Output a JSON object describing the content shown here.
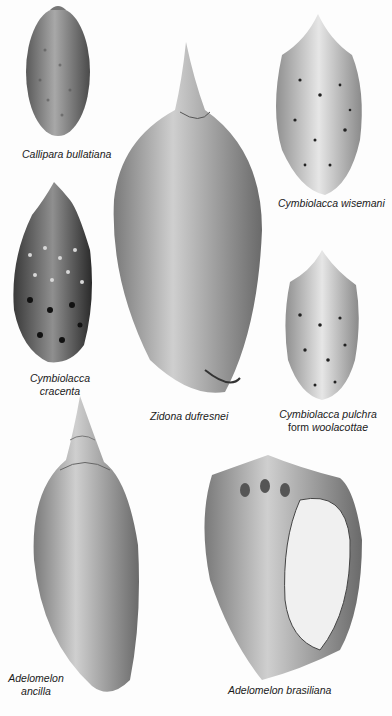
{
  "plate": {
    "background": "#fdfdfd",
    "shells": [
      {
        "id": "callipara-bullatiana",
        "caption": "Callipara bullatiana"
      },
      {
        "id": "zidona-dufresnei",
        "caption": "Zidona dufresnei"
      },
      {
        "id": "cymbiolacca-wisemani",
        "caption": "Cymbiolacca wisemani"
      },
      {
        "id": "cymbiolacca-cracenta",
        "caption_line1": "Cymbiolacca",
        "caption_line2": "cracenta"
      },
      {
        "id": "cymbiolacca-pulchra",
        "caption_line1": "Cymbiolacca pulchra",
        "caption_line2_prefix": "form ",
        "caption_line2_italic": "woolacottae"
      },
      {
        "id": "adelomelon-ancilla",
        "caption_line1": "Adelomelon",
        "caption_line2": "ancilla"
      },
      {
        "id": "adelomelon-brasiliana",
        "caption": "Adelomelon brasiliana"
      }
    ]
  }
}
